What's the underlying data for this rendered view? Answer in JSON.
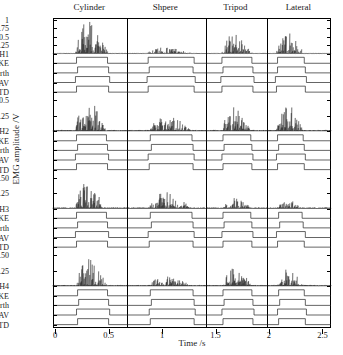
{
  "figure": {
    "ylabel": "EMG amplitude /V",
    "xlabel": "Time /s",
    "xlim": [
      -0.02,
      2.58
    ],
    "xticks": [
      0,
      0.5,
      1,
      1.5,
      2,
      2.5
    ],
    "xticklabels": [
      "0",
      "0.5",
      "1",
      "1.5",
      "2",
      "2.5"
    ]
  },
  "segments": [
    {
      "label": "Cylinder",
      "start": -0.02,
      "end": 0.66
    },
    {
      "label": "Shpere",
      "start": 0.66,
      "end": 1.4
    },
    {
      "label": "Tripod",
      "start": 1.4,
      "end": 1.97
    },
    {
      "label": "Lateral",
      "start": 1.97,
      "end": 2.58
    }
  ],
  "separators": [
    0.66,
    1.4,
    1.97
  ],
  "detectors": [
    "TKE",
    "Lidierth",
    "MAV",
    "STD"
  ],
  "chart_data": {
    "type": "line",
    "title": "",
    "xlabel": "Time /s",
    "ylabel": "EMG amplitude /V",
    "xlim": [
      -0.02,
      2.58
    ],
    "grid": false,
    "legend": "none",
    "panels": [
      {
        "channel": "CH1",
        "yticks": [
          1,
          0.75,
          0.5,
          0.25,
          0
        ],
        "yticklabels": [
          "1",
          "0.75",
          "0.5",
          "0.25",
          "CH1"
        ],
        "ylim": [
          0,
          1.05
        ],
        "bursts": [
          {
            "start": 0.19,
            "end": 0.5,
            "peak": 0.92
          },
          {
            "start": 0.86,
            "end": 1.3,
            "peak": 0.18
          },
          {
            "start": 1.56,
            "end": 1.85,
            "peak": 0.56
          },
          {
            "start": 2.07,
            "end": 2.33,
            "peak": 0.6
          }
        ],
        "detections": {
          "TKE": [
            [
              0.2,
              0.49
            ],
            [
              0.87,
              1.3
            ],
            [
              1.56,
              1.84
            ],
            [
              2.08,
              2.33
            ]
          ],
          "Lidierth": [
            [
              0.21,
              0.5
            ],
            [
              0.88,
              1.29
            ],
            [
              1.57,
              1.85
            ],
            [
              2.08,
              2.34
            ]
          ],
          "MAV": [
            [
              0.19,
              0.51
            ],
            [
              0.86,
              1.31
            ],
            [
              1.55,
              1.86
            ],
            [
              2.06,
              2.35
            ]
          ],
          "STD": [
            [
              0.2,
              0.5
            ],
            [
              0.87,
              1.3
            ],
            [
              1.56,
              1.85
            ],
            [
              2.07,
              2.34
            ]
          ]
        }
      },
      {
        "channel": "CH2",
        "yticks": [
          0.5,
          0.25,
          0
        ],
        "yticklabels": [
          "0.5",
          "0.25",
          "CH2"
        ],
        "ylim": [
          0,
          0.58
        ],
        "bursts": [
          {
            "start": 0.19,
            "end": 0.48,
            "peak": 0.52
          },
          {
            "start": 0.88,
            "end": 1.28,
            "peak": 0.25
          },
          {
            "start": 1.56,
            "end": 1.83,
            "peak": 0.4
          },
          {
            "start": 2.07,
            "end": 2.32,
            "peak": 0.42
          }
        ],
        "detections": {
          "TKE": [
            [
              0.2,
              0.48
            ],
            [
              0.89,
              1.28
            ],
            [
              1.57,
              1.83
            ],
            [
              2.08,
              2.32
            ]
          ],
          "Lidierth": [
            [
              0.21,
              0.49
            ],
            [
              0.9,
              1.29
            ],
            [
              1.58,
              1.84
            ],
            [
              2.09,
              2.33
            ]
          ],
          "MAV": [
            [
              0.19,
              0.5
            ],
            [
              0.87,
              1.3
            ],
            [
              1.56,
              1.85
            ],
            [
              2.07,
              2.34
            ]
          ],
          "STD": [
            [
              0.2,
              0.49
            ],
            [
              0.88,
              1.29
            ],
            [
              1.57,
              1.84
            ],
            [
              2.08,
              2.33
            ]
          ]
        }
      },
      {
        "channel": "CH3",
        "yticks": [
          0.5,
          0.25,
          0
        ],
        "yticklabels": [
          "0.50",
          "0.25",
          "CH3"
        ],
        "ylim": [
          0,
          0.58
        ],
        "bursts": [
          {
            "start": 0.19,
            "end": 0.47,
            "peak": 0.41
          },
          {
            "start": 0.88,
            "end": 1.28,
            "peak": 0.26
          },
          {
            "start": 1.57,
            "end": 1.84,
            "peak": 0.18
          },
          {
            "start": 2.08,
            "end": 2.31,
            "peak": 0.14
          }
        ],
        "detections": {
          "TKE": [
            [
              0.2,
              0.48
            ],
            [
              0.89,
              1.28
            ],
            [
              1.57,
              1.83
            ],
            [
              2.09,
              2.31
            ]
          ],
          "Lidierth": [
            [
              0.21,
              0.49
            ],
            [
              0.9,
              1.29
            ],
            [
              1.58,
              1.84
            ],
            [
              2.1,
              2.32
            ]
          ],
          "MAV": [
            [
              0.19,
              0.5
            ],
            [
              0.87,
              1.3
            ],
            [
              1.56,
              1.85
            ],
            [
              2.07,
              2.34
            ]
          ],
          "STD": [
            [
              0.2,
              0.49
            ],
            [
              0.88,
              1.29
            ],
            [
              1.57,
              1.84
            ],
            [
              2.08,
              2.33
            ]
          ]
        }
      },
      {
        "channel": "CH4",
        "yticks": [
          0.5,
          0.25,
          0
        ],
        "yticklabels": [
          "0.50",
          "0.25",
          "CH4"
        ],
        "ylim": [
          0,
          0.58
        ],
        "bursts": [
          {
            "start": 0.2,
            "end": 0.49,
            "peak": 0.44
          },
          {
            "start": 0.88,
            "end": 1.29,
            "peak": 0.16
          },
          {
            "start": 1.57,
            "end": 1.84,
            "peak": 0.3
          },
          {
            "start": 2.08,
            "end": 2.33,
            "peak": 0.28
          }
        ],
        "detections": {
          "TKE": [
            [
              0.21,
              0.49
            ],
            [
              0.89,
              1.29
            ],
            [
              1.57,
              1.84
            ],
            [
              2.09,
              2.33
            ]
          ],
          "Lidierth": [
            [
              0.22,
              0.5
            ],
            [
              0.9,
              1.3
            ],
            [
              1.58,
              1.85
            ],
            [
              2.1,
              2.34
            ]
          ],
          "MAV": [
            [
              0.2,
              0.51
            ],
            [
              0.88,
              1.31
            ],
            [
              1.56,
              1.86
            ],
            [
              2.08,
              2.35
            ]
          ],
          "STD": [
            [
              0.21,
              0.5
            ],
            [
              0.89,
              1.3
            ],
            [
              1.57,
              1.85
            ],
            [
              2.09,
              2.34
            ]
          ]
        }
      }
    ]
  }
}
